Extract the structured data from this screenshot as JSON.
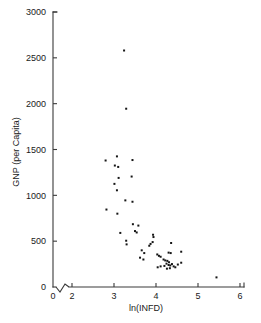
{
  "chart_data": {
    "type": "scatter",
    "title": "",
    "xlabel": "ln(INFD)",
    "ylabel": "GNP (per Capita)",
    "xlim": [
      1.55,
      6.0
    ],
    "ylim": [
      0,
      3000
    ],
    "xticks": [
      0,
      2,
      3,
      4,
      5,
      6
    ],
    "xtick_labels": [
      "0",
      "2",
      "3",
      "4",
      "5",
      "6"
    ],
    "yticks": [
      0,
      500,
      1000,
      1500,
      2000,
      2500,
      3000
    ],
    "ytick_labels": [
      "0",
      "500",
      "1000",
      "1500",
      "2000",
      "2500",
      "3000"
    ],
    "grid": false,
    "legend": null,
    "axis_break": {
      "axis": "x",
      "between": [
        0,
        2
      ],
      "style": "zigzag"
    },
    "marker": {
      "shape": "square",
      "size": 2,
      "color": "#161616"
    },
    "points": [
      {
        "x": 3.24,
        "y": 2580
      },
      {
        "x": 3.29,
        "y": 1945
      },
      {
        "x": 3.07,
        "y": 1425
      },
      {
        "x": 3.44,
        "y": 1385
      },
      {
        "x": 2.8,
        "y": 1380
      },
      {
        "x": 3.02,
        "y": 1325
      },
      {
        "x": 3.1,
        "y": 1310
      },
      {
        "x": 3.42,
        "y": 1205
      },
      {
        "x": 3.11,
        "y": 1190
      },
      {
        "x": 3.01,
        "y": 1125
      },
      {
        "x": 3.07,
        "y": 1055
      },
      {
        "x": 3.27,
        "y": 945
      },
      {
        "x": 3.44,
        "y": 930
      },
      {
        "x": 2.82,
        "y": 845
      },
      {
        "x": 3.08,
        "y": 800
      },
      {
        "x": 3.45,
        "y": 685
      },
      {
        "x": 3.58,
        "y": 670
      },
      {
        "x": 3.5,
        "y": 610
      },
      {
        "x": 3.54,
        "y": 595
      },
      {
        "x": 3.15,
        "y": 590
      },
      {
        "x": 3.93,
        "y": 570
      },
      {
        "x": 3.94,
        "y": 545
      },
      {
        "x": 3.29,
        "y": 505
      },
      {
        "x": 3.3,
        "y": 465
      },
      {
        "x": 3.92,
        "y": 490
      },
      {
        "x": 3.87,
        "y": 470
      },
      {
        "x": 3.84,
        "y": 450
      },
      {
        "x": 4.36,
        "y": 480
      },
      {
        "x": 3.66,
        "y": 400
      },
      {
        "x": 3.72,
        "y": 370
      },
      {
        "x": 4.03,
        "y": 355
      },
      {
        "x": 4.07,
        "y": 340
      },
      {
        "x": 4.11,
        "y": 330
      },
      {
        "x": 4.3,
        "y": 375
      },
      {
        "x": 4.35,
        "y": 370
      },
      {
        "x": 4.6,
        "y": 385
      },
      {
        "x": 3.62,
        "y": 320
      },
      {
        "x": 3.7,
        "y": 300
      },
      {
        "x": 4.18,
        "y": 300
      },
      {
        "x": 4.22,
        "y": 290
      },
      {
        "x": 4.27,
        "y": 285
      },
      {
        "x": 4.31,
        "y": 270
      },
      {
        "x": 4.25,
        "y": 255
      },
      {
        "x": 4.38,
        "y": 250
      },
      {
        "x": 4.3,
        "y": 240
      },
      {
        "x": 4.34,
        "y": 235
      },
      {
        "x": 4.2,
        "y": 230
      },
      {
        "x": 4.11,
        "y": 225
      },
      {
        "x": 4.04,
        "y": 215
      },
      {
        "x": 4.42,
        "y": 225
      },
      {
        "x": 4.46,
        "y": 215
      },
      {
        "x": 4.52,
        "y": 245
      },
      {
        "x": 4.6,
        "y": 265
      },
      {
        "x": 4.33,
        "y": 205
      },
      {
        "x": 4.26,
        "y": 200
      },
      {
        "x": 5.44,
        "y": 105
      }
    ]
  },
  "figure": {
    "background_color": "#ffffff",
    "ink_color": "#161616"
  }
}
